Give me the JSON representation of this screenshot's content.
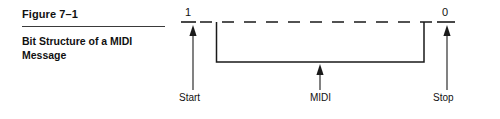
{
  "figure": {
    "label": "Figure 7–1",
    "caption": "Bit Structure of a MIDI Message"
  },
  "diagram": {
    "levels": {
      "high": "1",
      "low": "0"
    },
    "annotations": {
      "start": "Start",
      "midi": "MIDI",
      "stop": "Stop"
    },
    "colors": {
      "ink": "#1a1a1a",
      "rule": "#3a3a3a",
      "background": "#ffffff"
    }
  }
}
